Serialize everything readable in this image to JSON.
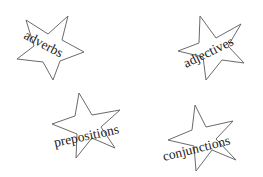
{
  "stars": [
    {
      "word": "adverbs",
      "cx": 50,
      "cy": 50,
      "r": 35,
      "rotate": -8,
      "text_x": 28,
      "text_y": 42,
      "text_rotate": 28
    },
    {
      "word": "adjectives",
      "cx": 208,
      "cy": 50,
      "r": 35,
      "rotate": 14,
      "text_x": 186,
      "text_y": 66,
      "text_rotate": -26
    },
    {
      "word": "prepositions",
      "cx": 85,
      "cy": 128,
      "r": 35,
      "rotate": 14,
      "text_x": 54,
      "text_y": 144,
      "text_rotate": -12
    },
    {
      "word": "conjunctions",
      "cx": 201,
      "cy": 139,
      "r": 35,
      "rotate": 10,
      "text_x": 166,
      "text_y": 158,
      "text_rotate": -14
    }
  ],
  "colors": {
    "stroke": "#6a6a6a",
    "text": "#222222",
    "background": "#ffffff"
  }
}
